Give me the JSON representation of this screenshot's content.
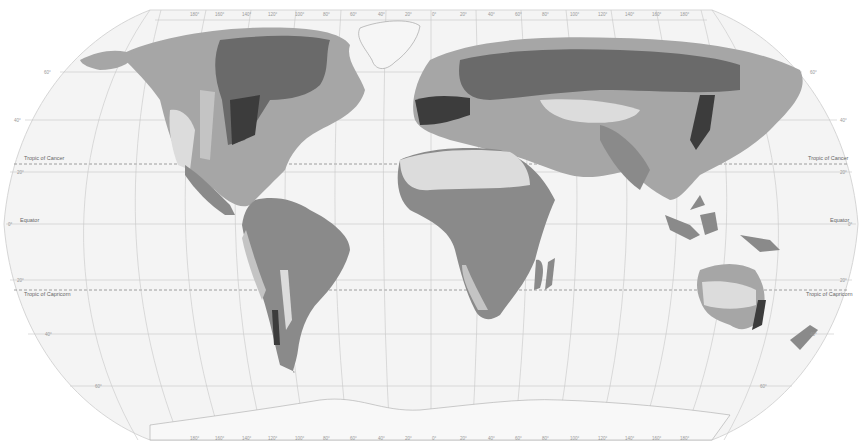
{
  "map": {
    "projection": "robinson-like",
    "style": "grayscale",
    "colors": {
      "ocean": "#f4f4f4",
      "outside": "#ffffff",
      "graticule": "#bcbcbc",
      "land_lightest": "#dcdcdc",
      "land_light": "#c4c4c4",
      "land_mid": "#a6a6a6",
      "land_dark": "#8a8a8a",
      "land_darker": "#6a6a6a",
      "land_darkest": "#3c3c3c",
      "ice": "#f6f6f6"
    },
    "lines": {
      "tropic_of_cancer_left": "Tropic of Cancer",
      "tropic_of_cancer_right": "Tropic of Cancer",
      "equator_left": "Equator",
      "equator_right": "Equator",
      "tropic_of_capricorn_left": "Tropic of Capricorn",
      "tropic_of_capricorn_right": "Tropic of Capricorn"
    },
    "latitude_ticks_left": [
      "60°",
      "40°",
      "20°",
      "0°",
      "20°",
      "40°",
      "60°"
    ],
    "latitude_ticks_right": [
      "60°",
      "40°",
      "20°",
      "0°",
      "20°",
      "40°",
      "60°"
    ],
    "longitude_ticks_top": [
      "180°",
      "160°",
      "140°",
      "120°",
      "100°",
      "80°",
      "60°",
      "40°",
      "20°",
      "0°",
      "20°",
      "40°",
      "60°",
      "80°",
      "100°",
      "120°",
      "140°",
      "160°",
      "180°"
    ],
    "longitude_ticks_bottom": [
      "180°",
      "160°",
      "140°",
      "120°",
      "100°",
      "80°",
      "60°",
      "40°",
      "20°",
      "0°",
      "20°",
      "40°",
      "60°",
      "80°",
      "100°",
      "120°",
      "140°",
      "160°",
      "180°"
    ]
  }
}
